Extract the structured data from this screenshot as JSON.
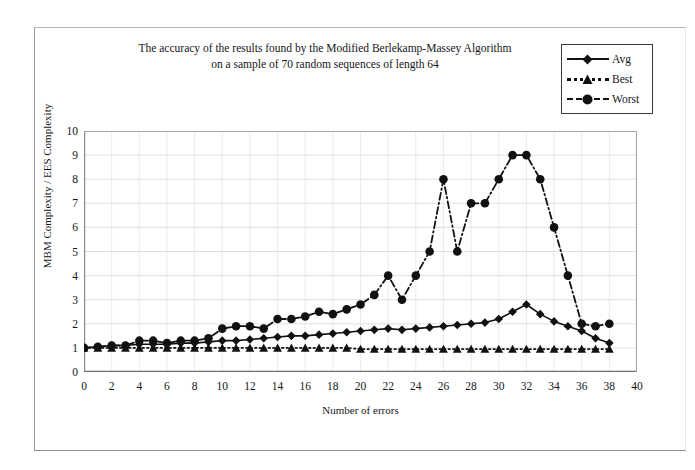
{
  "figure": {
    "title_lines": [
      "The accuracy of the results found by the Modified Berlekamp-Massey Algorithm",
      "on a sample of 70 random sequences of length 64"
    ]
  },
  "legend": {
    "position": "top-right",
    "items": [
      {
        "label": "Avg",
        "marker": "diamond",
        "line_style": "solid",
        "color": "#111111"
      },
      {
        "label": "Best",
        "marker": "triangle",
        "line_style": "dotted",
        "color": "#111111"
      },
      {
        "label": "Worst",
        "marker": "circle",
        "line_style": "dashdot",
        "color": "#111111"
      }
    ]
  },
  "axes": {
    "y_ticks": [
      "0",
      "1",
      "2",
      "3",
      "4",
      "5",
      "6",
      "7",
      "8",
      "9",
      "10"
    ],
    "x_ticks": [
      "0",
      "2",
      "4",
      "6",
      "8",
      "10",
      "12",
      "14",
      "16",
      "18",
      "20",
      "22",
      "24",
      "26",
      "28",
      "30",
      "32",
      "34",
      "36",
      "38",
      "40"
    ]
  },
  "chart_data": {
    "type": "line",
    "title": "The accuracy of the results found by the Modified Berlekamp-Massey Algorithm on a sample of 70 random sequences of length 64",
    "xlabel": "Number of errors",
    "ylabel": "MBM Complexity / EES Complexity",
    "xlim": [
      0,
      40
    ],
    "ylim": [
      0,
      10
    ],
    "xtick_step": 2,
    "ytick_step": 1,
    "grid": true,
    "legend_position": "top-right",
    "x": [
      0,
      1,
      2,
      3,
      4,
      5,
      6,
      7,
      8,
      9,
      10,
      11,
      12,
      13,
      14,
      15,
      16,
      17,
      18,
      19,
      20,
      21,
      22,
      23,
      24,
      25,
      26,
      27,
      28,
      29,
      30,
      31,
      32,
      33,
      34,
      35,
      36,
      37,
      38
    ],
    "series": [
      {
        "name": "Avg",
        "marker": "diamond",
        "line_style": "solid",
        "color": "#111111",
        "values": [
          1.0,
          1.05,
          1.1,
          1.1,
          1.15,
          1.15,
          1.15,
          1.2,
          1.2,
          1.25,
          1.3,
          1.3,
          1.35,
          1.4,
          1.45,
          1.5,
          1.5,
          1.55,
          1.6,
          1.65,
          1.7,
          1.75,
          1.8,
          1.75,
          1.8,
          1.85,
          1.9,
          1.95,
          2.0,
          2.05,
          2.2,
          2.5,
          2.8,
          2.4,
          2.1,
          1.9,
          1.7,
          1.4,
          1.2
        ]
      },
      {
        "name": "Best",
        "marker": "triangle",
        "line_style": "dotted",
        "color": "#111111",
        "values": [
          1.0,
          1.0,
          1.0,
          1.0,
          1.0,
          1.0,
          1.0,
          1.0,
          1.0,
          1.0,
          1.0,
          1.0,
          1.0,
          1.0,
          1.0,
          1.0,
          1.0,
          1.0,
          1.0,
          1.0,
          0.95,
          0.95,
          0.95,
          0.95,
          0.95,
          0.95,
          0.95,
          0.95,
          0.95,
          0.95,
          0.95,
          0.95,
          0.95,
          0.95,
          0.95,
          0.95,
          0.95,
          0.95,
          0.95
        ]
      },
      {
        "name": "Worst",
        "marker": "circle",
        "line_style": "dashdot",
        "color": "#111111",
        "values": [
          1.0,
          1.05,
          1.1,
          1.1,
          1.3,
          1.3,
          1.2,
          1.3,
          1.3,
          1.4,
          1.8,
          1.9,
          1.9,
          1.8,
          2.2,
          2.2,
          2.3,
          2.5,
          2.4,
          2.6,
          2.8,
          3.2,
          4.0,
          3.0,
          4.0,
          5.0,
          8.0,
          5.0,
          7.0,
          7.0,
          8.0,
          9.0,
          9.0,
          8.0,
          6.0,
          4.0,
          2.0,
          1.9,
          2.0
        ]
      }
    ]
  }
}
